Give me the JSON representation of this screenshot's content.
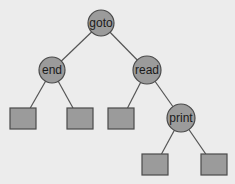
{
  "diagram": {
    "type": "binary-search-tree",
    "colors": {
      "background": "#ececec",
      "node_fill": "#9b9b9b",
      "node_stroke": "#4a4a4a",
      "edge": "#555555",
      "text": "#1a1a1a"
    },
    "nodes": [
      {
        "id": "goto",
        "label": "goto",
        "shape": "circle",
        "cx": 101,
        "cy": 23,
        "r": 13
      },
      {
        "id": "end",
        "label": "end",
        "shape": "circle",
        "cx": 52,
        "cy": 70,
        "r": 13
      },
      {
        "id": "read",
        "label": "read",
        "shape": "circle",
        "cx": 147,
        "cy": 70,
        "r": 14
      },
      {
        "id": "print",
        "label": "print",
        "shape": "circle",
        "cx": 181,
        "cy": 118,
        "r": 14
      },
      {
        "id": "leaf1",
        "label": "",
        "shape": "square",
        "x": 10,
        "y": 108,
        "w": 26,
        "h": 21
      },
      {
        "id": "leaf2",
        "label": "",
        "shape": "square",
        "x": 67,
        "y": 108,
        "w": 26,
        "h": 21
      },
      {
        "id": "leaf3",
        "label": "",
        "shape": "square",
        "x": 108,
        "y": 108,
        "w": 26,
        "h": 21
      },
      {
        "id": "leaf4",
        "label": "",
        "shape": "square",
        "x": 142,
        "y": 154,
        "w": 26,
        "h": 21
      },
      {
        "id": "leaf5",
        "label": "",
        "shape": "square",
        "x": 201,
        "y": 154,
        "w": 26,
        "h": 21
      }
    ],
    "edges": [
      {
        "from": "goto",
        "to": "end"
      },
      {
        "from": "goto",
        "to": "read"
      },
      {
        "from": "end",
        "to": "leaf1"
      },
      {
        "from": "end",
        "to": "leaf2"
      },
      {
        "from": "read",
        "to": "leaf3"
      },
      {
        "from": "read",
        "to": "print"
      },
      {
        "from": "print",
        "to": "leaf4"
      },
      {
        "from": "print",
        "to": "leaf5"
      }
    ]
  }
}
